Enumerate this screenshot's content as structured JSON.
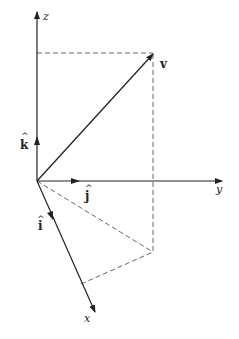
{
  "diagram": {
    "type": "3d-vector-decomposition",
    "axes": [
      {
        "name": "z",
        "label": "z"
      },
      {
        "name": "y",
        "label": "y"
      },
      {
        "name": "x",
        "label": "x"
      }
    ],
    "unit_vectors": [
      {
        "name": "k",
        "label": "k",
        "hat": "^"
      },
      {
        "name": "j",
        "label": "j",
        "hat": "^"
      },
      {
        "name": "i",
        "label": "i",
        "hat": "^"
      }
    ],
    "vector": {
      "label": "v"
    },
    "colors": {
      "line": "#222222",
      "dashed": "#555555",
      "background": "#ffffff"
    }
  }
}
